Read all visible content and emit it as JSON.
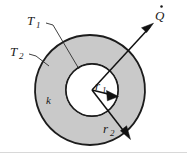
{
  "figure": {
    "background_color": "#ffffff",
    "shell_fill_color": "#c9c9c9",
    "bore_fill_color": "#ffffff",
    "outline_color": "#1c1c1c",
    "label_color": "#1a1a1a"
  },
  "labels": {
    "t1": {
      "symbol": "T",
      "subscript": "1",
      "text": "T1"
    },
    "t2": {
      "symbol": "T",
      "subscript": "2",
      "text": "T2"
    },
    "k": {
      "symbol": "k",
      "text": "k"
    },
    "r1": {
      "symbol": "r",
      "subscript": "1",
      "text": "r1"
    },
    "r2": {
      "symbol": "r",
      "subscript": "2",
      "text": "r2"
    },
    "qdot": {
      "symbol": "Q",
      "accent": "dot",
      "text": "Q"
    }
  },
  "geometry": {
    "outer_circle": {
      "cx": 90,
      "cy": 90,
      "r": 55
    },
    "inner_circle": {
      "cx": 92,
      "cy": 90,
      "r": 26
    }
  },
  "annotations": {
    "heat_flow_arrow": "Q-dot arrow pointing outward up-right",
    "r1_arrow": "radius arrow from center to inner surface",
    "r2_arrow": "radius arrow from center to outer surface",
    "t1_leader": "leader line from T1 label to inner surface",
    "t2_leader": "leader line from T2 label to outer surface"
  }
}
